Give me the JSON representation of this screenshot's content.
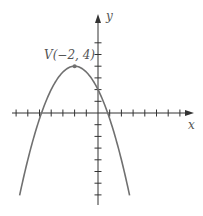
{
  "chart_data": {
    "type": "line",
    "title": "",
    "equation": "y = -0.5(x + 2)^2 + 4",
    "xlabel": "x",
    "ylabel": "y",
    "xlim": [
      -7.5,
      8
    ],
    "ylim": [
      -8.5,
      6
    ],
    "grid": false,
    "tick_spacing": 1,
    "series": [
      {
        "name": "parabola",
        "color": "#707070",
        "x_range": [
          -6.7,
          2.7
        ]
      }
    ],
    "annotations": [
      {
        "text": "V(−2, 4)",
        "x": -2,
        "y": 4,
        "type": "vertex-point"
      }
    ]
  },
  "layout": {
    "origin_px": [
      98,
      113
    ],
    "unit_px": 11.7,
    "axis_color": "#333333",
    "curve_color": "#707070"
  }
}
